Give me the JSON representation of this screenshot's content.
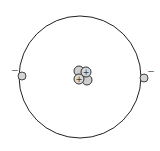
{
  "diagram": {
    "orbit": {
      "cx": 80,
      "cy": 77,
      "r": 61,
      "stroke": "#222222"
    },
    "nucleus": {
      "protons": [
        {
          "cx": 86,
          "cy": 72,
          "label": "+"
        },
        {
          "cx": 79,
          "cy": 79,
          "label": "+"
        }
      ],
      "neutrons": [
        {
          "cx": 79,
          "cy": 71
        },
        {
          "cx": 87,
          "cy": 80
        }
      ],
      "fill": "#cfcfcf",
      "stroke": "#333333"
    },
    "electrons": [
      {
        "cx": 22,
        "cy": 76,
        "label": "−",
        "label_x": 14,
        "label_y": 72
      },
      {
        "cx": 144,
        "cy": 77,
        "label": "−",
        "label_x": 150,
        "label_y": 73
      }
    ],
    "electron_fill": "#d4d4d4"
  }
}
